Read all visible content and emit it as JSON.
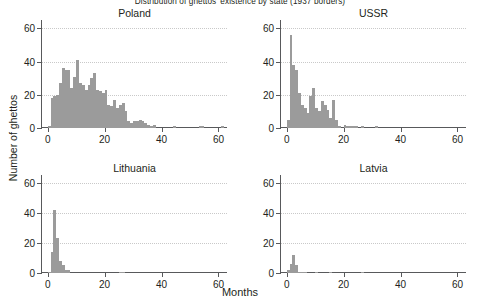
{
  "figure": {
    "suptitle": "Distribution of ghettos' existence by state (1937 borders)",
    "xlabel": "Months",
    "ylabel": "Number of ghettos",
    "bar_color": "#9b9b9b",
    "grid_color": "#c9c9c9",
    "axis_color": "#58595b"
  },
  "axes": {
    "xticks": [
      0,
      20,
      40,
      60
    ],
    "yticks": [
      0,
      20,
      40,
      60
    ],
    "xlim": [
      -2,
      63
    ],
    "ylim": [
      0,
      65
    ],
    "gridlines_y": [
      20,
      40,
      60
    ]
  },
  "chart_data": [
    {
      "type": "bar",
      "title": "Poland",
      "xlabel": "Months",
      "ylabel": "Number of ghettos",
      "xlim": [
        -2,
        63
      ],
      "ylim": [
        0,
        65
      ],
      "grid": true,
      "bin_width": 1,
      "x": [
        0,
        1,
        2,
        3,
        4,
        5,
        6,
        7,
        8,
        9,
        10,
        11,
        12,
        13,
        14,
        15,
        16,
        17,
        18,
        19,
        20,
        21,
        22,
        23,
        24,
        25,
        26,
        27,
        28,
        29,
        30,
        31,
        32,
        33,
        34,
        35,
        36,
        37,
        38,
        39,
        40,
        41,
        42,
        43,
        44,
        45,
        46,
        47,
        48,
        49,
        50,
        51,
        52,
        53,
        54,
        55,
        56,
        57,
        58,
        59,
        60,
        61
      ],
      "values": [
        1,
        18,
        19,
        20,
        27,
        36,
        35,
        35,
        24,
        31,
        41,
        27,
        26,
        23,
        26,
        30,
        33,
        23,
        22,
        21,
        23,
        14,
        13,
        17,
        12,
        14,
        15,
        10,
        4,
        3,
        4,
        4,
        5,
        4,
        3,
        2,
        1,
        2,
        0,
        0,
        0,
        0,
        0,
        0,
        1,
        0,
        0,
        0,
        0,
        0,
        0,
        0,
        0,
        1,
        1,
        0,
        0,
        0,
        0,
        0,
        0,
        1
      ]
    },
    {
      "type": "bar",
      "title": "USSR",
      "xlabel": "Months",
      "ylabel": "Number of ghettos",
      "xlim": [
        -2,
        63
      ],
      "ylim": [
        0,
        65
      ],
      "grid": true,
      "bin_width": 1,
      "x": [
        0,
        1,
        2,
        3,
        4,
        5,
        6,
        7,
        8,
        9,
        10,
        11,
        12,
        13,
        14,
        15,
        16,
        17,
        18,
        19,
        20,
        21,
        22,
        23,
        24,
        25,
        26,
        27,
        28,
        29,
        30,
        31,
        32,
        33,
        34,
        35,
        36,
        37,
        38,
        39,
        40,
        41,
        42,
        43,
        44,
        45,
        46,
        47,
        48,
        49,
        50,
        51,
        52,
        53,
        54,
        55,
        56,
        57,
        58,
        59,
        60,
        61
      ],
      "values": [
        5,
        56,
        38,
        35,
        21,
        14,
        12,
        9,
        19,
        24,
        12,
        10,
        16,
        14,
        11,
        6,
        17,
        5,
        1,
        0,
        2,
        1,
        1,
        1,
        1,
        0,
        1,
        0,
        0,
        0,
        0,
        1,
        0,
        0,
        0,
        0,
        0,
        0,
        0,
        0,
        0,
        0,
        0,
        0,
        0,
        0,
        0,
        0,
        0,
        0,
        0,
        0,
        0,
        0,
        0,
        0,
        0,
        0,
        0,
        0,
        0,
        0
      ]
    },
    {
      "type": "bar",
      "title": "Lithuania",
      "xlabel": "Months",
      "ylabel": "Number of ghettos",
      "xlim": [
        -2,
        63
      ],
      "ylim": [
        0,
        65
      ],
      "grid": true,
      "bin_width": 1,
      "x": [
        0,
        1,
        2,
        3,
        4,
        5,
        6,
        7,
        8,
        9,
        10,
        11,
        12,
        13,
        14,
        15,
        16,
        17,
        18,
        19,
        20,
        21,
        22,
        23,
        24,
        25,
        26,
        27,
        28,
        29,
        30,
        31,
        32,
        33,
        34,
        35,
        36,
        37,
        38,
        39,
        40,
        41,
        42,
        43,
        44,
        45,
        46,
        47,
        48,
        49,
        50,
        51,
        52,
        53,
        54,
        55,
        56,
        57,
        58,
        59,
        60,
        61
      ],
      "values": [
        1,
        14,
        42,
        23,
        8,
        5,
        2,
        2,
        0,
        0,
        0,
        0,
        0,
        0,
        0,
        0,
        0,
        0,
        0,
        0,
        0,
        0,
        0,
        0,
        0,
        1,
        1,
        0,
        0,
        0,
        0,
        0,
        0,
        0,
        0,
        0,
        0,
        0,
        0,
        0,
        0,
        0,
        0,
        0,
        0,
        0,
        0,
        0,
        0,
        0,
        0,
        0,
        0,
        0,
        0,
        0,
        0,
        0,
        0,
        0,
        0,
        0
      ]
    },
    {
      "type": "bar",
      "title": "Latvia",
      "xlabel": "Months",
      "ylabel": "Number of ghettos",
      "xlim": [
        -2,
        63
      ],
      "ylim": [
        0,
        65
      ],
      "grid": true,
      "bin_width": 1,
      "x": [
        0,
        1,
        2,
        3,
        4,
        5,
        6,
        7,
        8,
        9,
        10,
        11,
        12,
        13,
        14,
        15,
        16,
        17,
        18,
        19,
        20,
        21,
        22,
        23,
        24,
        25,
        26,
        27,
        28,
        29,
        30,
        31,
        32,
        33,
        34,
        35,
        36,
        37,
        38,
        39,
        40,
        41,
        42,
        43,
        44,
        45,
        46,
        47,
        48,
        49,
        50,
        51,
        52,
        53,
        54,
        55,
        56,
        57,
        58,
        59,
        60,
        61
      ],
      "values": [
        2,
        6,
        12,
        5,
        1,
        1,
        1,
        0,
        0,
        0,
        1,
        0,
        0,
        0,
        0,
        1,
        0,
        0,
        0,
        0,
        0,
        0,
        0,
        0,
        0,
        0,
        1,
        0,
        0,
        0,
        0,
        0,
        0,
        0,
        0,
        0,
        0,
        0,
        0,
        0,
        0,
        0,
        0,
        0,
        0,
        0,
        0,
        0,
        0,
        0,
        0,
        0,
        0,
        0,
        0,
        0,
        0,
        0,
        0,
        0,
        0,
        0
      ]
    }
  ]
}
